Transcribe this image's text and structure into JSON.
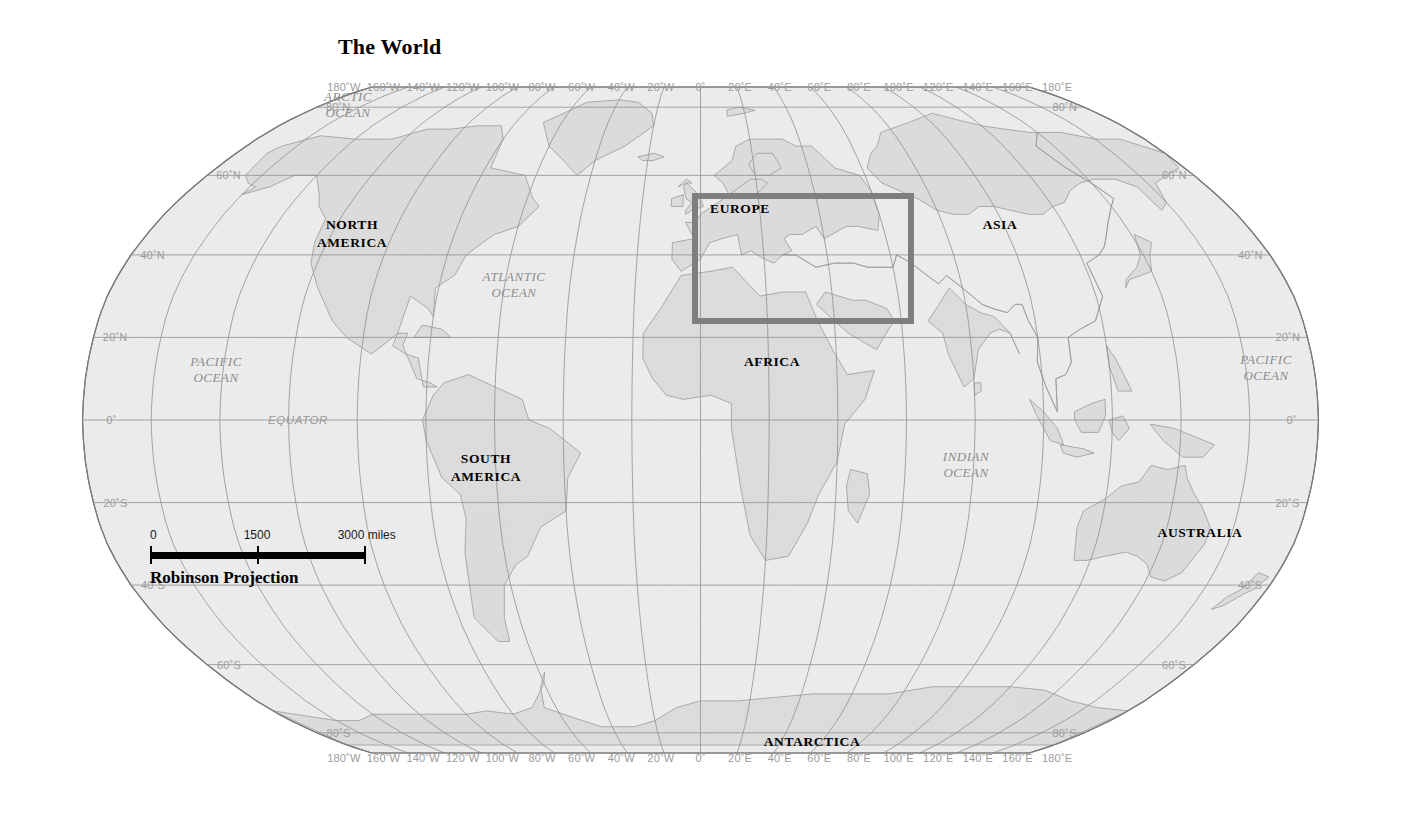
{
  "map": {
    "title": "The World",
    "projection_label": "Robinson Projection",
    "ocean_fill": "#ececec",
    "land_fill": "#dcdcdc",
    "graticule_color": "#8f8f8f",
    "outline_color": "#7a7a7a",
    "coastline_color": "#9a9a9a",
    "highlight_color": "#7f7f7f"
  },
  "scale_bar": {
    "unit_label": "3000 miles",
    "ticks": [
      {
        "label": "0",
        "value": 0
      },
      {
        "label": "1500",
        "value": 1500
      },
      {
        "label": "3000 miles",
        "value": 3000
      }
    ]
  },
  "continents": [
    {
      "name": "north-america",
      "lines": [
        "NORTH",
        "AMERICA"
      ],
      "x": 352,
      "y": 234
    },
    {
      "name": "south-america",
      "lines": [
        "SOUTH",
        "AMERICA"
      ],
      "x": 486,
      "y": 468
    },
    {
      "name": "europe",
      "lines": [
        "EUROPE"
      ],
      "x": 740,
      "y": 209
    },
    {
      "name": "africa",
      "lines": [
        "AFRICA"
      ],
      "x": 772,
      "y": 362
    },
    {
      "name": "asia",
      "lines": [
        "ASIA"
      ],
      "x": 1000,
      "y": 225
    },
    {
      "name": "australia",
      "lines": [
        "AUSTRALIA"
      ],
      "x": 1200,
      "y": 533
    },
    {
      "name": "antarctica",
      "lines": [
        "ANTARCTICA"
      ],
      "x": 812,
      "y": 742
    }
  ],
  "oceans": [
    {
      "name": "arctic-ocean",
      "lines": [
        "ARCTIC",
        "OCEAN"
      ],
      "x": 348,
      "y": 105
    },
    {
      "name": "pacific-ocean-west",
      "lines": [
        "PACIFIC",
        "OCEAN"
      ],
      "x": 216,
      "y": 370
    },
    {
      "name": "atlantic-ocean",
      "lines": [
        "ATLANTIC",
        "OCEAN"
      ],
      "x": 514,
      "y": 285
    },
    {
      "name": "indian-ocean",
      "lines": [
        "INDIAN",
        "OCEAN"
      ],
      "x": 966,
      "y": 465
    },
    {
      "name": "pacific-ocean-east",
      "lines": [
        "PACIFIC",
        "OCEAN"
      ],
      "x": 1266,
      "y": 368
    }
  ],
  "equator_label": "EQUATOR",
  "highlight_box": {
    "label": "EUROPE",
    "left": 692,
    "top": 193,
    "width": 222,
    "height": 131
  },
  "longitude_labels": [
    "180˚W",
    "160˚W",
    "140˚W",
    "120˚W",
    "100˚W",
    "80˚W",
    "60˚W",
    "40˚W",
    "20˚W",
    "0˚",
    "20˚E",
    "40˚E",
    "60˚E",
    "80˚E",
    "100˚E",
    "120˚E",
    "140˚E",
    "160˚E",
    "180˚E"
  ],
  "latitude_labels": [
    "80˚N",
    "60˚N",
    "40˚N",
    "20˚N",
    "0˚",
    "20˚S",
    "40˚S",
    "60˚S",
    "80˚S"
  ],
  "latitude_values": [
    80,
    60,
    40,
    20,
    0,
    -20,
    -40,
    -60,
    -80
  ],
  "longitude_values": [
    -180,
    -160,
    -140,
    -120,
    -100,
    -80,
    -60,
    -40,
    -20,
    0,
    20,
    40,
    60,
    80,
    100,
    120,
    140,
    160,
    180
  ]
}
